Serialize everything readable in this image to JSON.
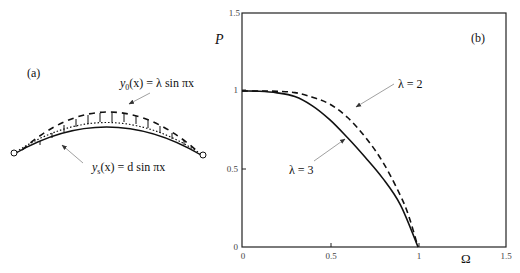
{
  "panel_a": {
    "label": "(a)",
    "y0_label": {
      "func": "y",
      "sub": "0",
      "arg": "(x)",
      "rhs": " = λ sin πx"
    },
    "ys_label": {
      "func": "y",
      "sub": "s",
      "arg": "(x)",
      "rhs": " =  d sin πx"
    }
  },
  "panel_b": {
    "label": "(b)",
    "ylabel": "P",
    "xlabel": "Ω",
    "annotations": [
      "λ = 2",
      "λ = 3"
    ]
  },
  "chart_data": {
    "type": "line",
    "title": "(b)",
    "xlabel": "Ω",
    "ylabel": "P",
    "xlim": [
      0,
      1.5
    ],
    "ylim": [
      0,
      1.5
    ],
    "xticks": [
      "0",
      "0.5",
      "1",
      "1.5"
    ],
    "yticks": [
      "0",
      "0.5",
      "1",
      "1.5"
    ],
    "grid": false,
    "legend": "none (inline annotations with arrows)",
    "series": [
      {
        "name": "λ = 3",
        "style": "solid",
        "x": [
          0,
          0.1,
          0.2,
          0.3,
          0.4,
          0.5,
          0.6,
          0.7,
          0.8,
          0.9,
          1.0
        ],
        "y": [
          1.0,
          0.998,
          0.988,
          0.965,
          0.905,
          0.815,
          0.7,
          0.575,
          0.44,
          0.27,
          0.0
        ]
      },
      {
        "name": "λ = 2",
        "style": "dashed",
        "x": [
          0,
          0.1,
          0.2,
          0.3,
          0.4,
          0.5,
          0.6,
          0.7,
          0.8,
          0.9,
          0.95,
          1.0
        ],
        "y": [
          1.0,
          1.0,
          0.998,
          0.99,
          0.96,
          0.915,
          0.83,
          0.705,
          0.545,
          0.33,
          0.19,
          0.0
        ]
      }
    ]
  }
}
